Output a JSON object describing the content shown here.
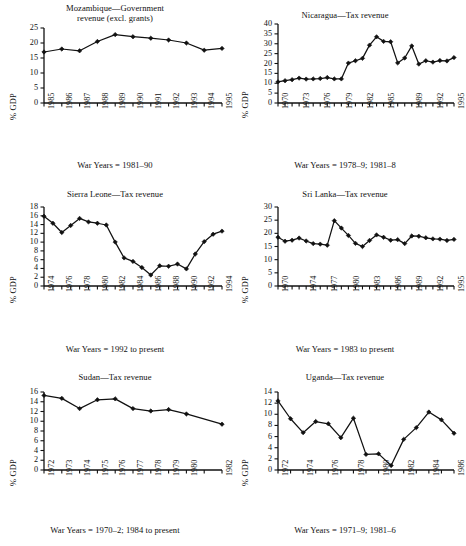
{
  "figure": {
    "panel_count": 6,
    "ylabel_common": "% GDP"
  },
  "panels": [
    {
      "id": "mozambique",
      "title": "Mozambique—Government\nrevenue (excl. grants)",
      "ylabel": "% GDP",
      "xcaption": "War Years = 1981–90",
      "ytick_labels": [
        "0",
        "5",
        "10",
        "15",
        "20",
        "25"
      ],
      "xtick_labels": [
        "1985",
        "1986",
        "1987",
        "1988",
        "1989",
        "1990",
        "1991",
        "1992",
        "1993",
        "1994",
        "1995"
      ]
    },
    {
      "id": "nicaragua",
      "title": "Nicaragua—Tax revenue",
      "ylabel": "% GDP",
      "xcaption": "War Years = 1978–9; 1981–8",
      "ytick_labels": [
        "0",
        "5",
        "10",
        "15",
        "20",
        "25",
        "30",
        "35",
        "40"
      ],
      "xtick_labels": [
        "1970",
        "1973",
        "1976",
        "1979",
        "1982",
        "1985",
        "1989",
        "1992",
        "1995"
      ]
    },
    {
      "id": "sierra-leone",
      "title": "Sierra Leone—Tax revenue",
      "ylabel": "% GDP",
      "xcaption": "War Years = 1992 to present",
      "ytick_labels": [
        "0",
        "2",
        "4",
        "6",
        "8",
        "10",
        "12",
        "14",
        "16",
        "18"
      ],
      "xtick_labels": [
        "1974",
        "1976",
        "1978",
        "1980",
        "1982",
        "1984",
        "1986",
        "1988",
        "1990",
        "1992",
        "1994"
      ]
    },
    {
      "id": "sri-lanka",
      "title": "Sri Lanka—Tax revenue",
      "ylabel": "% GDP",
      "xcaption": "War Years = 1983 to present",
      "ytick_labels": [
        "0",
        "5",
        "10",
        "15",
        "20",
        "25",
        "30"
      ],
      "xtick_labels": [
        "1970",
        "1974",
        "1977",
        "1980",
        "1983",
        "1986",
        "1989",
        "1992",
        "1995"
      ]
    },
    {
      "id": "sudan",
      "title": "Sudan—Tax revenue",
      "ylabel": "% GDP",
      "xcaption": "War Years = 1970–2; 1984 to present",
      "ytick_labels": [
        "0",
        "2",
        "4",
        "6",
        "8",
        "10",
        "12",
        "14",
        "16"
      ],
      "xtick_labels": [
        "1972",
        "1973",
        "1974",
        "1975",
        "1976",
        "1977",
        "1978",
        "1979",
        "1980",
        "1982"
      ]
    },
    {
      "id": "uganda",
      "title": "Uganda—Tax revenue",
      "ylabel": "% GDP",
      "xcaption": "War Years = 1971–9; 1981–6",
      "ytick_labels": [
        "0",
        "2",
        "4",
        "6",
        "8",
        "10",
        "12",
        "14"
      ],
      "xtick_labels": [
        "1972",
        "1974",
        "1976",
        "1978",
        "1980",
        "1982",
        "1984",
        "1986"
      ]
    }
  ],
  "chart_data": [
    {
      "type": "line",
      "id": "mozambique",
      "title": "Mozambique—Government revenue (excl. grants)",
      "xlabel": "War Years = 1981–90",
      "ylabel": "% GDP",
      "ylim": [
        0,
        25
      ],
      "yticks": [
        0,
        5,
        10,
        15,
        20,
        25
      ],
      "xlim": [
        1985,
        1995
      ],
      "xticks": [
        1985,
        1986,
        1987,
        1988,
        1989,
        1990,
        1991,
        1992,
        1993,
        1994,
        1995
      ],
      "grid": false,
      "legend": "none",
      "marker": "filled-diamond",
      "x": [
        1985,
        1986,
        1987,
        1988,
        1989,
        1990,
        1991,
        1992,
        1993,
        1994,
        1995
      ],
      "values": [
        17.0,
        18.0,
        17.4,
        20.5,
        22.8,
        22.1,
        21.6,
        21.0,
        20.0,
        17.6,
        18.2
      ]
    },
    {
      "type": "line",
      "id": "nicaragua",
      "title": "Nicaragua—Tax revenue",
      "xlabel": "War Years = 1978–9; 1981–8",
      "ylabel": "% GDP",
      "ylim": [
        0,
        40
      ],
      "yticks": [
        0,
        5,
        10,
        15,
        20,
        25,
        30,
        35,
        40
      ],
      "xlim": [
        1970,
        1995
      ],
      "xticks": [
        1970,
        1973,
        1976,
        1979,
        1982,
        1985,
        1989,
        1992,
        1995
      ],
      "grid": false,
      "legend": "none",
      "marker": "filled-diamond",
      "x": [
        1970,
        1971,
        1972,
        1973,
        1974,
        1975,
        1976,
        1977,
        1978,
        1979,
        1980,
        1981,
        1982,
        1983,
        1984,
        1985,
        1986,
        1987,
        1988,
        1989,
        1990,
        1991,
        1992,
        1993,
        1994,
        1995
      ],
      "values": [
        10.7,
        11.3,
        11.8,
        12.6,
        12.1,
        12.2,
        12.4,
        12.9,
        12.2,
        12.2,
        20.2,
        21.4,
        22.6,
        29.3,
        33.5,
        31.2,
        31.0,
        20.3,
        22.8,
        28.9,
        19.7,
        21.4,
        20.7,
        21.5,
        21.3,
        23.0
      ]
    },
    {
      "type": "line",
      "id": "sierra-leone",
      "title": "Sierra Leone—Tax revenue",
      "xlabel": "War Years = 1992 to present",
      "ylabel": "% GDP",
      "ylim": [
        0,
        18
      ],
      "yticks": [
        0,
        2,
        4,
        6,
        8,
        10,
        12,
        14,
        16,
        18
      ],
      "xlim": [
        1974,
        1994
      ],
      "xticks": [
        1974,
        1976,
        1978,
        1980,
        1982,
        1984,
        1986,
        1988,
        1990,
        1992,
        1994
      ],
      "grid": false,
      "legend": "none",
      "marker": "filled-diamond",
      "x": [
        1974,
        1975,
        1976,
        1977,
        1978,
        1979,
        1980,
        1981,
        1982,
        1983,
        1984,
        1985,
        1986,
        1987,
        1988,
        1989,
        1990,
        1991,
        1992,
        1993,
        1994
      ],
      "values": [
        15.9,
        14.3,
        12.2,
        13.8,
        15.4,
        14.6,
        14.3,
        13.9,
        10.0,
        6.4,
        5.6,
        4.2,
        2.5,
        4.6,
        4.5,
        5.0,
        3.9,
        7.3,
        10.1,
        11.8,
        12.5
      ]
    },
    {
      "type": "line",
      "id": "sri-lanka",
      "title": "Sri Lanka—Tax revenue",
      "xlabel": "War Years = 1983 to present",
      "ylabel": "% GDP",
      "ylim": [
        0,
        30
      ],
      "yticks": [
        0,
        5,
        10,
        15,
        20,
        25,
        30
      ],
      "xlim": [
        1970,
        1995
      ],
      "xticks": [
        1970,
        1974,
        1977,
        1980,
        1983,
        1986,
        1989,
        1992,
        1995
      ],
      "grid": false,
      "legend": "none",
      "marker": "filled-diamond",
      "x": [
        1970,
        1971,
        1972,
        1973,
        1974,
        1975,
        1976,
        1977,
        1978,
        1979,
        1980,
        1981,
        1982,
        1983,
        1984,
        1985,
        1986,
        1987,
        1988,
        1989,
        1990,
        1991,
        1992,
        1993,
        1994,
        1995
      ],
      "values": [
        18.5,
        17.0,
        17.4,
        18.2,
        17.1,
        16.1,
        15.9,
        15.5,
        24.8,
        22.0,
        19.2,
        16.2,
        15.0,
        17.3,
        19.4,
        18.5,
        17.4,
        17.6,
        16.1,
        19.0,
        18.9,
        18.3,
        17.9,
        17.8,
        17.3,
        17.7
      ]
    },
    {
      "type": "line",
      "id": "sudan",
      "title": "Sudan—Tax revenue",
      "xlabel": "War Years = 1970–2; 1984 to present",
      "ylabel": "% GDP",
      "ylim": [
        0,
        16
      ],
      "yticks": [
        0,
        2,
        4,
        6,
        8,
        10,
        12,
        14,
        16
      ],
      "xlim": [
        1972,
        1982
      ],
      "xticks": [
        1972,
        1973,
        1974,
        1975,
        1976,
        1977,
        1978,
        1979,
        1980,
        1982
      ],
      "grid": false,
      "legend": "none",
      "marker": "filled-diamond",
      "x": [
        1972,
        1973,
        1974,
        1975,
        1976,
        1977,
        1978,
        1979,
        1980,
        1982
      ],
      "values": [
        15.3,
        14.7,
        12.6,
        14.4,
        14.6,
        12.6,
        12.1,
        12.4,
        11.5,
        9.4
      ]
    },
    {
      "type": "line",
      "id": "uganda",
      "title": "Uganda—Tax revenue",
      "xlabel": "War Years = 1971–9; 1981–6",
      "ylabel": "% GDP",
      "ylim": [
        0,
        14
      ],
      "yticks": [
        0,
        2,
        4,
        6,
        8,
        10,
        12,
        14
      ],
      "xlim": [
        1972,
        1986
      ],
      "xticks": [
        1972,
        1974,
        1976,
        1978,
        1980,
        1982,
        1984,
        1986
      ],
      "grid": false,
      "legend": "none",
      "marker": "filled-diamond",
      "x": [
        1972,
        1973,
        1974,
        1975,
        1976,
        1977,
        1978,
        1979,
        1980,
        1981,
        1982,
        1983,
        1984,
        1985,
        1986
      ],
      "values": [
        12.4,
        9.2,
        6.7,
        8.7,
        8.3,
        5.8,
        9.3,
        2.8,
        2.9,
        0.8,
        5.5,
        7.6,
        10.4,
        9.0,
        6.6
      ]
    }
  ]
}
